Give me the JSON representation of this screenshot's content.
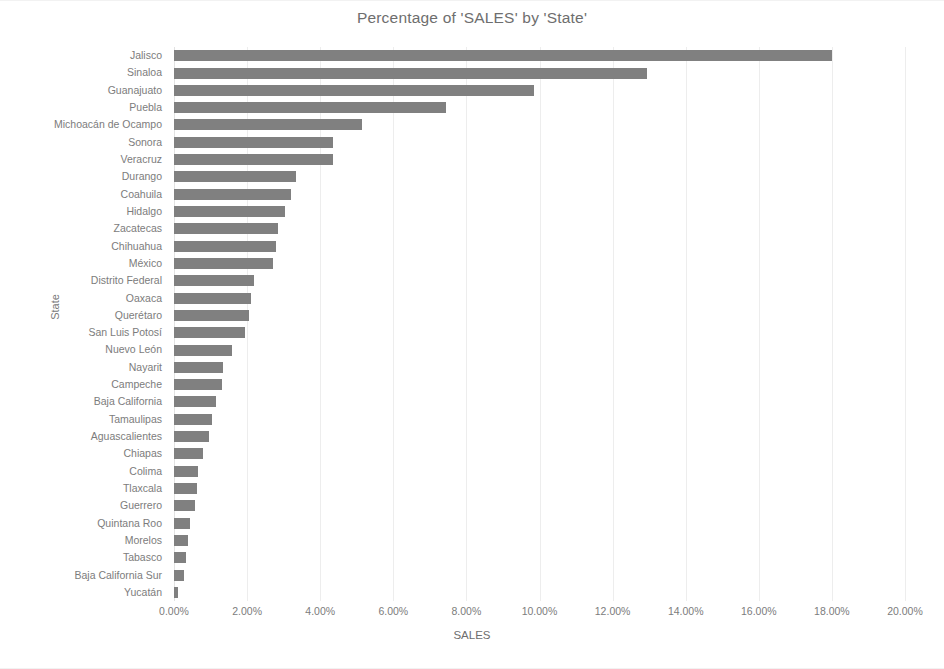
{
  "chart_data": {
    "type": "bar",
    "orientation": "horizontal",
    "title": "Percentage of 'SALES' by 'State'",
    "xlabel": "SALES",
    "ylabel": "State",
    "xlim": [
      0,
      20
    ],
    "xtick_labels": [
      "0.00%",
      "2.00%",
      "4.00%",
      "6.00%",
      "8.00%",
      "10.00%",
      "12.00%",
      "14.00%",
      "16.00%",
      "18.00%",
      "20.00%"
    ],
    "xtick_values": [
      0,
      2,
      4,
      6,
      8,
      10,
      12,
      14,
      16,
      18,
      20
    ],
    "grid": true,
    "legend": false,
    "value_suffix": "%",
    "bar_color": "#808080",
    "categories": [
      "Jalisco",
      "Sinaloa",
      "Guanajuato",
      "Puebla",
      "Michoacán de Ocampo",
      "Sonora",
      "Veracruz",
      "Durango",
      "Coahuila",
      "Hidalgo",
      "Zacatecas",
      "Chihuahua",
      "México",
      "Distrito Federal",
      "Oaxaca",
      "Querétaro",
      "San Luis Potosí",
      "Nuevo León",
      "Nayarit",
      "Campeche",
      "Baja California",
      "Tamaulipas",
      "Aguascalientes",
      "Chiapas",
      "Colima",
      "Tlaxcala",
      "Guerrero",
      "Quintana Roo",
      "Morelos",
      "Tabasco",
      "Baja California Sur",
      "Yucatán"
    ],
    "values": [
      18.0,
      12.95,
      9.85,
      7.45,
      5.15,
      4.35,
      4.35,
      3.35,
      3.2,
      3.05,
      2.85,
      2.8,
      2.7,
      2.2,
      2.1,
      2.05,
      1.95,
      1.6,
      1.35,
      1.3,
      1.15,
      1.05,
      0.95,
      0.8,
      0.65,
      0.62,
      0.58,
      0.45,
      0.38,
      0.32,
      0.28,
      0.12
    ]
  }
}
